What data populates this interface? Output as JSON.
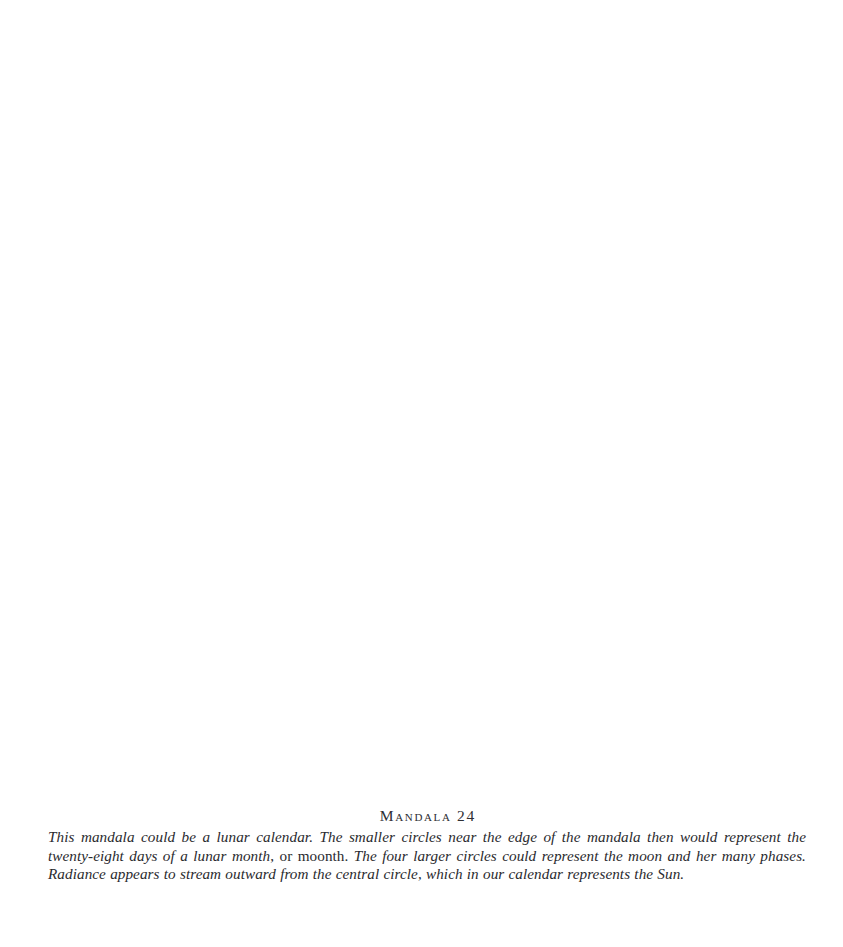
{
  "page": {
    "background_color": "#ffffff",
    "text_color": "#2a2a2e",
    "width": 843,
    "height": 947
  },
  "plate": {
    "region_label": "",
    "description": "blank illustration area"
  },
  "caption": {
    "title": "Mandala 24",
    "title_number": "24",
    "title_name": "Mandala",
    "body_full": "This mandala could be a lunar calendar. The smaller circles near the edge of the mandala then would represent the twenty-eight days of a lunar month, or moonth. The four larger circles could represent the moon and her many phases. Radiance appears to stream outward from the central circle, which in our calendar represents the Sun.",
    "segments": {
      "s1": "This mandala could be a lunar calendar. The smaller circles near the edge of the mandala then would represent the twenty-eight days of a lunar month",
      "s2": ", or moonth.",
      "s3": " The four larger circles could represent the moon and her many phases. Radiance appears to stream outward from the central circle, which in our calendar represents the Sun."
    },
    "lines": [
      "This mandala could be a lunar calendar. The smaller circles near the edge of the mandala then would represent the twenty-",
      "eight days of a lunar month, or moonth. The four larger circles could represent the moon and her many phases. Radiance",
      "appears to stream outward from the central circle, which in our calendar represents the Sun."
    ]
  }
}
